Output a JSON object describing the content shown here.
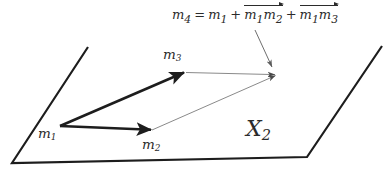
{
  "figure": {
    "type": "vector-parallelogram-diagram",
    "background_color": "#ffffff",
    "ink_color": "#2b2b2b",
    "thin_line_color": "#8a8a8a"
  },
  "equation": {
    "lhs_symbol": "m",
    "lhs_sub": "4",
    "equals": "=",
    "term1_symbol": "m",
    "term1_sub": "1",
    "plus1": "+",
    "vec1_a_symbol": "m",
    "vec1_a_sub": "1",
    "vec1_b_symbol": "m",
    "vec1_b_sub": "2",
    "plus2": "+",
    "vec2_a_symbol": "m",
    "vec2_a_sub": "1",
    "vec2_b_symbol": "m",
    "vec2_b_sub": "3",
    "plain_text": "m4 = m1 + vec(m1m2) + vec(m1m3)"
  },
  "labels": {
    "m1": {
      "symbol": "m",
      "sub": "1"
    },
    "m2": {
      "symbol": "m",
      "sub": "2"
    },
    "m3": {
      "symbol": "m",
      "sub": "3"
    },
    "plane": {
      "symbol": "X",
      "sub": "2"
    }
  },
  "geometry": {
    "plane_outline": {
      "points": "88,47 12,163 307,157 382,46",
      "stroke_width": 2.2,
      "note": "open quadrilateral, drawn as three connected edges"
    },
    "bold_vectors": [
      {
        "name": "m1-to-m3",
        "from": [
          60,
          126
        ],
        "to": [
          185,
          72
        ]
      },
      {
        "name": "m1-to-m2",
        "from": [
          60,
          126
        ],
        "to": [
          152,
          130
        ]
      }
    ],
    "thin_vectors": [
      {
        "name": "m3-to-m4",
        "from": [
          185,
          72
        ],
        "to": [
          277,
          75
        ]
      },
      {
        "name": "m2-to-m4",
        "from": [
          152,
          130
        ],
        "to": [
          277,
          75
        ]
      }
    ],
    "pointer_arrow": {
      "from": [
        255,
        30
      ],
      "to": [
        273,
        69
      ]
    },
    "vertex_m4": [
      277,
      75
    ]
  }
}
